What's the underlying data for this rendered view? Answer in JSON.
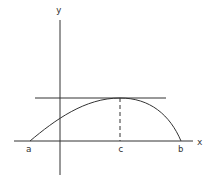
{
  "diagram": {
    "type": "function-graph",
    "axes": {
      "x_label": "x",
      "y_label": "y"
    },
    "points": {
      "a_label": "a",
      "c_label": "c",
      "b_label": "b"
    },
    "elements": [
      {
        "kind": "x-axis",
        "label": "x"
      },
      {
        "kind": "y-axis",
        "label": "y"
      },
      {
        "kind": "curve",
        "from": "a",
        "to": "b",
        "max_at": "c"
      },
      {
        "kind": "horizontal-tangent",
        "at": "c"
      },
      {
        "kind": "dashed-vertical",
        "at": "c"
      }
    ],
    "colors": {
      "stroke": "#333333"
    }
  }
}
